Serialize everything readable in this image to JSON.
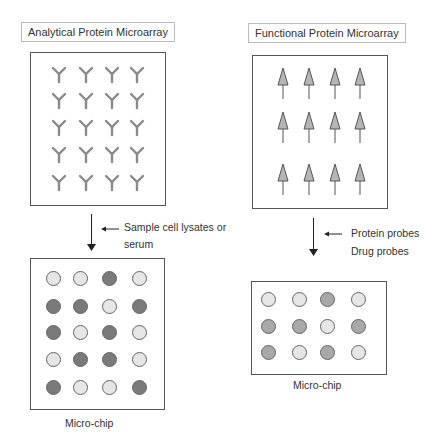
{
  "left": {
    "title": "Analytical Protein Microarray",
    "capture_icon": "antibody-icon",
    "rows": 5,
    "cols": 4,
    "step_label_line1": "Sample cell lysates or",
    "step_label_line2": "serum",
    "chip_label": "Micro-chip",
    "chip_spots": [
      [
        "light",
        "light",
        "dark",
        "light"
      ],
      [
        "dark",
        "dark",
        "light",
        "dark"
      ],
      [
        "dark",
        "light",
        "dark",
        "light"
      ],
      [
        "light",
        "dark",
        "dark",
        "light"
      ],
      [
        "dark",
        "light",
        "light",
        "dark"
      ]
    ]
  },
  "right": {
    "title": "Functional Protein Microarray",
    "capture_icon": "protein-arrow-icon",
    "rows": 3,
    "cols": 4,
    "step_label_line1": "Protein probes",
    "step_label_line2": "Drug probes",
    "chip_label": "Micro-chip",
    "chip_spots": [
      [
        "light",
        "light",
        "mid",
        "light"
      ],
      [
        "mid",
        "mid",
        "light",
        "mid"
      ],
      [
        "mid",
        "light",
        "mid",
        "light"
      ]
    ]
  },
  "colors": {
    "light": "#e6e6e6",
    "dark": "#7a7a7a",
    "mid": "#a8a8a8",
    "antibody": "#8a8a8a",
    "triangle_fill": "#b5b5b5"
  }
}
